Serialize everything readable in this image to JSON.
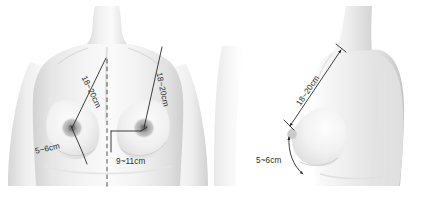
{
  "figure": {
    "background_color": "#ffffff",
    "skin_color": "#ededed",
    "line_color": "#1d1d1d",
    "text_color": "#2b2b2b",
    "views": [
      {
        "id": "frontal",
        "name": "frontal-view",
        "label": "Frontal view of female torso"
      },
      {
        "id": "profile",
        "name": "profile-view",
        "label": "Profile (side) view of female torso"
      }
    ]
  },
  "measurements": {
    "frontal": {
      "sternal_notch_to_left_nipple": "18~20cm",
      "sternal_notch_to_right_nipple": "18~20cm",
      "nipple_to_inframammary_fold": "5~6cm",
      "midline_to_nipple": "9~11cm"
    },
    "profile": {
      "sternal_notch_to_nipple": "18~20cm",
      "nipple_to_inframammary_fold": "5~6cm"
    }
  },
  "annotations": [
    {
      "id": "a1",
      "view": "frontal",
      "name": "label-sternal-to-left-nipple",
      "text": "18~20cm"
    },
    {
      "id": "a2",
      "view": "frontal",
      "name": "label-sternal-to-right-nipple",
      "text": "18~20cm"
    },
    {
      "id": "a3",
      "view": "frontal",
      "name": "label-nipple-to-fold",
      "text": "5~6cm"
    },
    {
      "id": "a4",
      "view": "frontal",
      "name": "label-midline-to-nipple",
      "text": "9~11cm"
    },
    {
      "id": "a5",
      "view": "profile",
      "name": "label-sternal-to-nipple",
      "text": "18~20cm"
    },
    {
      "id": "a6",
      "view": "profile",
      "name": "label-nipple-to-fold",
      "text": "5~6cm"
    }
  ]
}
